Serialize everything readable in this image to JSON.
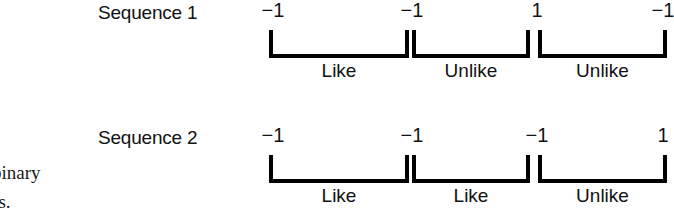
{
  "figure": {
    "background_color": "#ffffff",
    "ink_color": "#000000",
    "caption_fragments": [
      "binary",
      "es."
    ],
    "sequences": [
      {
        "label": "Sequence 1",
        "values": [
          "−1",
          "−1",
          "1",
          "−1"
        ],
        "value_x": [
          273,
          412,
          537,
          663
        ],
        "groups": [
          {
            "label": "Like",
            "left": 269,
            "right": 409
          },
          {
            "label": "Unlike",
            "left": 412,
            "right": 530
          },
          {
            "label": "Unlike",
            "left": 538,
            "right": 667
          }
        ]
      },
      {
        "label": "Sequence 2",
        "values": [
          "−1",
          "−1",
          "−1",
          "1"
        ],
        "value_x": [
          273,
          412,
          537,
          663
        ],
        "groups": [
          {
            "label": "Like",
            "left": 269,
            "right": 409
          },
          {
            "label": "Like",
            "left": 412,
            "right": 530
          },
          {
            "label": "Unlike",
            "left": 538,
            "right": 667
          }
        ]
      }
    ]
  },
  "chart_data": {
    "type": "table",
    "title": "",
    "xlabel": "",
    "ylabel": "",
    "categories": [
      "Position 1",
      "Position 2",
      "Position 3",
      "Position 4"
    ],
    "series": [
      {
        "name": "Sequence 1",
        "values": [
          -1,
          -1,
          1,
          -1
        ]
      },
      {
        "name": "Sequence 2",
        "values": [
          -1,
          -1,
          -1,
          1
        ]
      }
    ],
    "annotations": [
      {
        "series": "Sequence 1",
        "pair": "1-2",
        "label": "Like"
      },
      {
        "series": "Sequence 1",
        "pair": "2-3",
        "label": "Unlike"
      },
      {
        "series": "Sequence 1",
        "pair": "3-4",
        "label": "Unlike"
      },
      {
        "series": "Sequence 2",
        "pair": "1-2",
        "label": "Like"
      },
      {
        "series": "Sequence 2",
        "pair": "2-3",
        "label": "Like"
      },
      {
        "series": "Sequence 2",
        "pair": "3-4",
        "label": "Unlike"
      }
    ],
    "legend": []
  }
}
